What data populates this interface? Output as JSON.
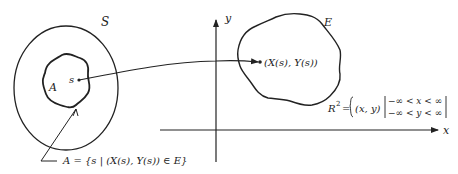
{
  "diagram": {
    "sample_space": {
      "label": "S"
    },
    "event_in_S": {
      "label": "A"
    },
    "point": {
      "label": "s"
    },
    "event_in_plane": {
      "label": "E"
    },
    "image_point": {
      "label": "(X(s), Y(s))"
    },
    "axes": {
      "x_label": "x",
      "y_label": "y"
    },
    "plane_definition": {
      "lhs": "R",
      "superscript": "2",
      "equals": "=",
      "set_var": "(x, y)",
      "condition_1": "−∞ < x < ∞",
      "condition_2": "−∞ < y < ∞"
    },
    "set_definition": "A = {s | (X(s), Y(s)) ∈ E}"
  },
  "colors": {
    "stroke": "#222222",
    "background": "#ffffff"
  }
}
